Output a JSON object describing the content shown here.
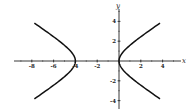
{
  "chart_data": {
    "type": "line",
    "title": "",
    "xlabel": "x",
    "ylabel": "y",
    "equation": "(x+2)^2/4 - y^2/2 = 1",
    "xlim": [
      -10,
      6
    ],
    "ylim": [
      -5,
      5.5
    ],
    "x_ticks": [
      -8,
      -6,
      -4,
      -2,
      2,
      4
    ],
    "x_tick_labels": [
      "-8",
      "-6",
      "-4",
      "-2",
      "2",
      "4"
    ],
    "y_ticks": [
      4,
      2,
      -2,
      -4
    ],
    "y_tick_labels": [
      "4",
      "2",
      "-2",
      "-4"
    ],
    "grid": false,
    "legend": null,
    "series": [
      {
        "name": "left branch",
        "x": [
          -9.3,
          -8,
          -7,
          -6,
          -5,
          -4.5,
          -4.2,
          -4,
          -4.2,
          -4.5,
          -5,
          -6,
          -7,
          -8,
          -9.3
        ],
        "y": [
          4.86,
          4.47,
          3.81,
          3.16,
          2.65,
          2.12,
          1.35,
          0,
          -1.35,
          -2.12,
          -2.65,
          -3.16,
          -3.81,
          -4.47,
          -4.86
        ]
      },
      {
        "name": "right branch",
        "x": [
          5.3,
          4,
          3,
          2,
          1,
          0.5,
          0.2,
          0,
          0.2,
          0.5,
          1,
          2,
          3,
          4,
          5.3
        ],
        "y": [
          4.86,
          4.47,
          3.81,
          3.16,
          2.24,
          1.5,
          0.93,
          0,
          -0.93,
          -1.5,
          -2.24,
          -3.16,
          -3.81,
          -4.47,
          -4.86
        ]
      }
    ],
    "vertices": [
      [
        -4,
        0
      ],
      [
        0,
        0
      ]
    ],
    "center": [
      -2,
      0
    ]
  },
  "axes": {
    "x_label": "x",
    "y_label": "y"
  },
  "colors": {
    "curve": "#111111",
    "axis": "#222222",
    "background": "#ffffff"
  }
}
